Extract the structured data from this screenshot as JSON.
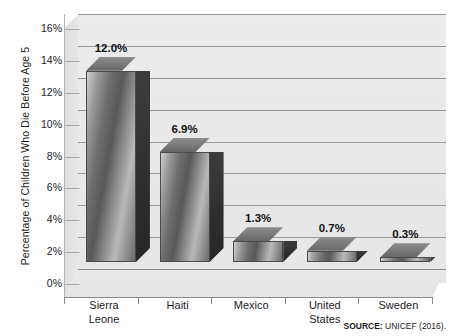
{
  "chart_data": {
    "type": "bar",
    "title": "",
    "subtitle": "",
    "xlabel": "",
    "ylabel": "Percentage of Children Who Die Before Age 5",
    "categories": [
      "Sierra\nLeone",
      "Haiti",
      "Mexico",
      "United\nStates",
      "Sweden"
    ],
    "values": [
      12.0,
      6.9,
      1.3,
      0.7,
      0.3
    ],
    "data_labels": [
      "12.0%",
      "6.9%",
      "1.3%",
      "0.7%",
      "0.3%"
    ],
    "ylim": [
      0,
      16
    ],
    "ytick_values": [
      16,
      14,
      12,
      10,
      8,
      6,
      4,
      2,
      0
    ],
    "ytick_labels": [
      "16%",
      "14%",
      "12%",
      "10%",
      "8%",
      "6%",
      "4%",
      "2%",
      "0%"
    ],
    "grid": true,
    "grid_axis": "y",
    "legend": false,
    "style": "3d-bar",
    "colors": {
      "plot_background": "#e9e9e9",
      "gridline": "#9a9a9a",
      "bar_front_light": "#c9c9c9",
      "bar_front_dark": "#585858",
      "bar_side": "#2e2e2e",
      "bar_top": "#7a7a7a",
      "text": "#1c1c1c",
      "page_background": "#ffffff"
    }
  },
  "source": {
    "label": "SOURCE:",
    "text": " UNICEF (2016)."
  }
}
